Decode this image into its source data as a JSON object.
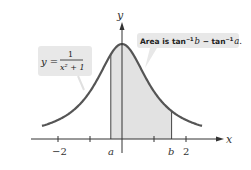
{
  "figure": {
    "axes": {
      "x_label": "x",
      "y_label": "y",
      "tick_labels": [
        "−2",
        "2"
      ],
      "tick_positions": [
        -2,
        -1,
        1,
        2
      ]
    },
    "curve": {
      "equation_lhs": "y =",
      "equation_numerator": "1",
      "equation_denominator": "x² + 1",
      "x_range": [
        -2.5,
        2.5
      ]
    },
    "region": {
      "left_label": "a",
      "right_label": "b",
      "a_value": -0.35,
      "b_value": 1.55
    },
    "callout": {
      "area_text_prefix": "Area is tan",
      "sup1": "−1",
      "b": "b",
      "minus": " − tan",
      "sup2": "−1",
      "a": "a",
      "period": "."
    },
    "colors": {
      "curve": "#555555",
      "fill": "#e2e2e2",
      "callout_bg": "#e8e8e8",
      "axis": "#333333"
    }
  }
}
